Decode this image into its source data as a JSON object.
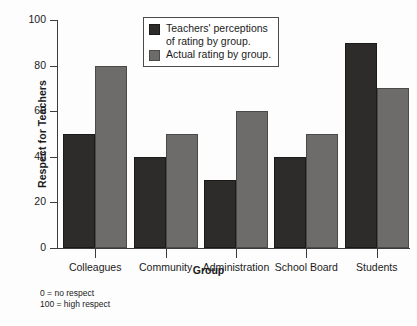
{
  "chart_data": {
    "type": "bar",
    "title": "",
    "xlabel": "Group",
    "ylabel": "Respect for Teachers",
    "ylim": [
      0,
      100
    ],
    "yticks": [
      0,
      20,
      40,
      60,
      80,
      100
    ],
    "grid": false,
    "legend_position": "top-center",
    "categories": [
      "Colleagues",
      "Community",
      "Administration",
      "School Board",
      "Students"
    ],
    "series": [
      {
        "name": "Teachers' perceptions of rating by group.",
        "color": "#2e2c2a",
        "values": [
          50,
          40,
          30,
          40,
          90
        ]
      },
      {
        "name": "Actual rating by group.",
        "color": "#6e6c6a",
        "values": [
          80,
          50,
          60,
          50,
          70
        ]
      }
    ],
    "annotations": [
      "0 = no respect",
      "100 = high respect"
    ]
  },
  "legend": {
    "items": [
      {
        "label_line1": "Teachers' perceptions",
        "label_line2": "of rating by group."
      },
      {
        "label_line1": "Actual rating by group.",
        "label_line2": ""
      }
    ]
  },
  "footnote": {
    "line1": "0 = no respect",
    "line2": "100 = high respect"
  }
}
